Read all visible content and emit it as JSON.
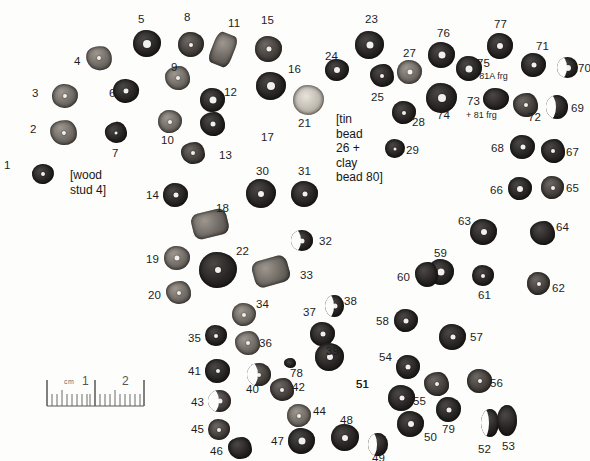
{
  "figure": {
    "kind": "archaeological-bead-layout-photograph",
    "background_color": "#fdfdfc",
    "bead_color_dark": "#262322",
    "bead_color_mid": "#433e3a",
    "bead_color_light": "#6f6963",
    "hole_color": "#f2f0ee"
  },
  "annotations": {
    "wood_stud": "[wood\nstud 4]",
    "tin_clay": "[tin\nbead\n26 +\nclay\nbead 80]",
    "frg_81a": "+81A frg",
    "frg_81": "+ 81 frg"
  },
  "scale": {
    "cm_label": "cm",
    "tick_1": "1",
    "tick_2": "2"
  },
  "beads": [
    {
      "id": "1",
      "label": "1",
      "x": 32,
      "y": 164,
      "w": 22,
      "h": 20,
      "tone": "t-dark",
      "shape": "sh-poly",
      "hole": 4,
      "lx": 4,
      "ly": 160,
      "rot": -8
    },
    {
      "id": "2",
      "label": "2",
      "x": 50,
      "y": 120,
      "w": 27,
      "h": 25,
      "tone": "t-light",
      "shape": "sh-poly2",
      "hole": 4,
      "lx": 30,
      "ly": 124,
      "rot": 6
    },
    {
      "id": "3",
      "label": "3",
      "x": 52,
      "y": 84,
      "w": 26,
      "h": 24,
      "tone": "t-light",
      "shape": "sh-poly",
      "hole": 4,
      "lx": 32,
      "ly": 88,
      "rot": -4
    },
    {
      "id": "4",
      "label": "4",
      "x": 86,
      "y": 46,
      "w": 26,
      "h": 24,
      "tone": "t-light",
      "shape": "sh-poly2",
      "hole": 4,
      "lx": 74,
      "ly": 56,
      "rot": 10
    },
    {
      "id": "5",
      "label": "5",
      "x": 133,
      "y": 30,
      "w": 28,
      "h": 27,
      "tone": "t-dark",
      "shape": "sh-poly",
      "hole": 8,
      "lx": 138,
      "ly": 14,
      "rot": 0
    },
    {
      "id": "6",
      "label": "6",
      "x": 113,
      "y": 79,
      "w": 26,
      "h": 24,
      "tone": "t-dark",
      "shape": "sh-poly",
      "hole": 5,
      "lx": 109,
      "ly": 88,
      "rot": 4
    },
    {
      "id": "7",
      "label": "7",
      "x": 105,
      "y": 122,
      "w": 22,
      "h": 21,
      "tone": "t-dark",
      "shape": "sh-poly2",
      "hole": 3,
      "lx": 112,
      "ly": 148,
      "rot": -6
    },
    {
      "id": "8",
      "label": "8",
      "x": 178,
      "y": 32,
      "w": 26,
      "h": 25,
      "tone": "t-mid",
      "shape": "sh-poly",
      "hole": 4,
      "lx": 184,
      "ly": 12,
      "rot": 0
    },
    {
      "id": "9",
      "label": "9",
      "x": 165,
      "y": 66,
      "w": 25,
      "h": 24,
      "tone": "t-light",
      "shape": "sh-poly2",
      "hole": 4,
      "lx": 171,
      "ly": 62,
      "rot": 0
    },
    {
      "id": "10",
      "label": "10",
      "x": 158,
      "y": 110,
      "w": 24,
      "h": 23,
      "tone": "t-light",
      "shape": "sh-poly",
      "hole": 4,
      "lx": 161,
      "ly": 135,
      "rot": 0
    },
    {
      "id": "11",
      "label": "11",
      "x": 212,
      "y": 33,
      "w": 22,
      "h": 33,
      "tone": "t-light",
      "shape": "sh-tube",
      "hole": 0,
      "lx": 228,
      "ly": 18,
      "rot": 22
    },
    {
      "id": "12",
      "label": "12",
      "x": 200,
      "y": 88,
      "w": 25,
      "h": 24,
      "tone": "t-dark",
      "shape": "sh-poly",
      "hole": 7,
      "lx": 224,
      "ly": 87,
      "rot": 0
    },
    {
      "id": "13",
      "label": "13",
      "x": 181,
      "y": 142,
      "w": 24,
      "h": 22,
      "tone": "t-mid",
      "shape": "sh-poly2",
      "hole": 4,
      "lx": 219,
      "ly": 150,
      "rot": 0
    },
    {
      "id": "14",
      "label": "14",
      "x": 163,
      "y": 183,
      "w": 25,
      "h": 24,
      "tone": "t-dark",
      "shape": "sh-poly",
      "hole": 5,
      "lx": 146,
      "ly": 190,
      "rot": 0
    },
    {
      "id": "15",
      "label": "15",
      "x": 255,
      "y": 36,
      "w": 27,
      "h": 26,
      "tone": "t-mid",
      "shape": "sh-poly",
      "hole": 5,
      "lx": 261,
      "ly": 15,
      "rot": 0
    },
    {
      "id": "16",
      "label": "16",
      "x": 256,
      "y": 72,
      "w": 30,
      "h": 28,
      "tone": "t-dark",
      "shape": "sh-poly",
      "hole": 8,
      "lx": 288,
      "ly": 64,
      "rot": 0
    },
    {
      "id": "17",
      "label": "17",
      "x": 200,
      "y": 112,
      "w": 25,
      "h": 24,
      "tone": "t-dark",
      "shape": "sh-poly2",
      "hole": 5,
      "lx": 261,
      "ly": 132,
      "rot": 0
    },
    {
      "id": "18",
      "label": "18",
      "x": 192,
      "y": 211,
      "w": 36,
      "h": 26,
      "tone": "t-light",
      "shape": "sh-tube",
      "hole": 0,
      "lx": 216,
      "ly": 203,
      "rot": -14
    },
    {
      "id": "19",
      "label": "19",
      "x": 164,
      "y": 246,
      "w": 26,
      "h": 24,
      "tone": "t-light",
      "shape": "sh-poly",
      "hole": 5,
      "lx": 146,
      "ly": 254,
      "rot": 0
    },
    {
      "id": "20",
      "label": "20",
      "x": 166,
      "y": 281,
      "w": 25,
      "h": 23,
      "tone": "t-light",
      "shape": "sh-poly2",
      "hole": 4,
      "lx": 148,
      "ly": 290,
      "rot": 0
    },
    {
      "id": "21",
      "label": "21",
      "x": 293,
      "y": 85,
      "w": 31,
      "h": 30,
      "tone": "t-speck",
      "shape": "sh-poly",
      "hole": 0,
      "lx": 298,
      "ly": 118,
      "rot": 0
    },
    {
      "id": "22",
      "label": "22",
      "x": 199,
      "y": 252,
      "w": 38,
      "h": 36,
      "tone": "t-dark",
      "shape": "sh-poly",
      "hole": 6,
      "lx": 236,
      "ly": 246,
      "rot": 0
    },
    {
      "id": "23",
      "label": "23",
      "x": 355,
      "y": 31,
      "w": 29,
      "h": 28,
      "tone": "t-dark",
      "shape": "sh-poly",
      "hole": 7,
      "lx": 365,
      "ly": 14,
      "rot": 0
    },
    {
      "id": "24",
      "label": "24",
      "x": 325,
      "y": 59,
      "w": 24,
      "h": 22,
      "tone": "t-dark",
      "shape": "sh-poly",
      "hole": 6,
      "lx": 325,
      "ly": 51,
      "rot": 0
    },
    {
      "id": "25",
      "label": "25",
      "x": 370,
      "y": 64,
      "w": 24,
      "h": 23,
      "tone": "t-dark",
      "shape": "sh-poly2",
      "hole": 4,
      "lx": 371,
      "ly": 92,
      "rot": 0
    },
    {
      "id": "27",
      "label": "27",
      "x": 397,
      "y": 60,
      "w": 25,
      "h": 24,
      "tone": "t-light",
      "shape": "sh-poly",
      "hole": 5,
      "lx": 403,
      "ly": 48,
      "rot": 0
    },
    {
      "id": "28",
      "label": "28",
      "x": 392,
      "y": 101,
      "w": 24,
      "h": 23,
      "tone": "t-dark",
      "shape": "sh-poly",
      "hole": 4,
      "lx": 412,
      "ly": 117,
      "rot": 0
    },
    {
      "id": "29",
      "label": "29",
      "x": 385,
      "y": 139,
      "w": 20,
      "h": 19,
      "tone": "t-dark",
      "shape": "sh-poly",
      "hole": 3,
      "lx": 406,
      "ly": 145,
      "rot": 0
    },
    {
      "id": "30",
      "label": "30",
      "x": 246,
      "y": 179,
      "w": 30,
      "h": 29,
      "tone": "t-dark",
      "shape": "sh-poly",
      "hole": 6,
      "lx": 256,
      "ly": 166,
      "rot": 0
    },
    {
      "id": "31",
      "label": "31",
      "x": 291,
      "y": 181,
      "w": 27,
      "h": 26,
      "tone": "t-dark",
      "shape": "sh-poly",
      "hole": 5,
      "lx": 298,
      "ly": 166,
      "rot": 0
    },
    {
      "id": "32",
      "label": "32",
      "x": 291,
      "y": 230,
      "w": 22,
      "h": 21,
      "tone": "t-dark",
      "shape": "crescent",
      "hole": 5,
      "lx": 319,
      "ly": 236,
      "rot": 0
    },
    {
      "id": "33",
      "label": "33",
      "x": 253,
      "y": 258,
      "w": 36,
      "h": 27,
      "tone": "t-light",
      "shape": "sh-tube",
      "hole": 0,
      "lx": 300,
      "ly": 270,
      "rot": -16
    },
    {
      "id": "34",
      "label": "34",
      "x": 232,
      "y": 303,
      "w": 24,
      "h": 23,
      "tone": "t-light",
      "shape": "sh-poly",
      "hole": 4,
      "lx": 256,
      "ly": 299,
      "rot": 0
    },
    {
      "id": "35",
      "label": "35",
      "x": 205,
      "y": 325,
      "w": 22,
      "h": 21,
      "tone": "t-dark",
      "shape": "sh-poly",
      "hole": 4,
      "lx": 188,
      "ly": 333,
      "rot": 0
    },
    {
      "id": "36",
      "label": "36",
      "x": 235,
      "y": 331,
      "w": 25,
      "h": 24,
      "tone": "t-light",
      "shape": "sh-poly2",
      "hole": 4,
      "lx": 259,
      "ly": 338,
      "rot": 0
    },
    {
      "id": "37",
      "label": "37",
      "x": 310,
      "y": 322,
      "w": 25,
      "h": 24,
      "tone": "t-dark",
      "shape": "sh-poly",
      "hole": 5,
      "lx": 303,
      "ly": 307,
      "rot": 0
    },
    {
      "id": "38",
      "label": "38",
      "x": 325,
      "y": 295,
      "w": 19,
      "h": 22,
      "tone": "t-dark",
      "shape": "crescent",
      "hole": 5,
      "lx": 344,
      "ly": 296,
      "rot": 0
    },
    {
      "id": "39",
      "label": "39",
      "x": 315,
      "y": 343,
      "w": 29,
      "h": 28,
      "tone": "t-dark",
      "shape": "sh-poly",
      "hole": 6,
      "lx": 326,
      "ly": 346,
      "rot": 0
    },
    {
      "id": "40",
      "label": "40",
      "x": 247,
      "y": 363,
      "w": 24,
      "h": 23,
      "tone": "t-mid",
      "shape": "crescent",
      "hole": 4,
      "lx": 246,
      "ly": 384,
      "rot": 0
    },
    {
      "id": "41",
      "label": "41",
      "x": 205,
      "y": 359,
      "w": 25,
      "h": 24,
      "tone": "t-dark",
      "shape": "sh-poly",
      "hole": 4,
      "lx": 188,
      "ly": 366,
      "rot": 0
    },
    {
      "id": "42",
      "label": "42",
      "x": 270,
      "y": 378,
      "w": 24,
      "h": 23,
      "tone": "t-mid",
      "shape": "sh-poly2",
      "hole": 4,
      "lx": 292,
      "ly": 382,
      "rot": 0
    },
    {
      "id": "43",
      "label": "43",
      "x": 208,
      "y": 390,
      "w": 23,
      "h": 22,
      "tone": "t-mid",
      "shape": "crescent",
      "hole": 5,
      "lx": 191,
      "ly": 397,
      "rot": 0
    },
    {
      "id": "44",
      "label": "44",
      "x": 287,
      "y": 404,
      "w": 24,
      "h": 23,
      "tone": "t-light",
      "shape": "sh-poly",
      "hole": 4,
      "lx": 313,
      "ly": 406,
      "rot": 0
    },
    {
      "id": "45",
      "label": "45",
      "x": 208,
      "y": 419,
      "w": 22,
      "h": 21,
      "tone": "t-mid",
      "shape": "sh-poly",
      "hole": 4,
      "lx": 191,
      "ly": 424,
      "rot": 0
    },
    {
      "id": "46",
      "label": "46",
      "x": 228,
      "y": 437,
      "w": 24,
      "h": 22,
      "tone": "t-dark",
      "shape": "sh-poly2",
      "hole": 0,
      "lx": 210,
      "ly": 446,
      "rot": 0
    },
    {
      "id": "47",
      "label": "47",
      "x": 288,
      "y": 428,
      "w": 27,
      "h": 26,
      "tone": "t-dark",
      "shape": "sh-poly",
      "hole": 7,
      "lx": 271,
      "ly": 436,
      "rot": 0
    },
    {
      "id": "48",
      "label": "48",
      "x": 331,
      "y": 424,
      "w": 28,
      "h": 27,
      "tone": "t-dark",
      "shape": "sh-poly",
      "hole": 6,
      "lx": 340,
      "ly": 415,
      "rot": 0
    },
    {
      "id": "49",
      "label": "49",
      "x": 368,
      "y": 433,
      "w": 20,
      "h": 23,
      "tone": "t-dark",
      "shape": "crescent",
      "hole": 0,
      "lx": 372,
      "ly": 453,
      "rot": 0
    },
    {
      "id": "50",
      "label": "50",
      "x": 397,
      "y": 411,
      "w": 27,
      "h": 26,
      "tone": "t-dark",
      "shape": "sh-poly",
      "hole": 6,
      "lx": 424,
      "ly": 432,
      "rot": 0
    },
    {
      "id": "51",
      "label": "51",
      "x": 556,
      "y": 999,
      "w": 0,
      "h": 0,
      "tone": "t-dark",
      "shape": "sh-poly",
      "hole": 0,
      "lx": 356,
      "ly": 379,
      "rot": 0
    },
    {
      "id": "52",
      "label": "52",
      "x": 481,
      "y": 409,
      "w": 18,
      "h": 28,
      "tone": "t-dark",
      "shape": "crescent",
      "hole": 0,
      "lx": 478,
      "ly": 444,
      "rot": 0
    },
    {
      "id": "53",
      "label": "53",
      "x": 497,
      "y": 405,
      "w": 20,
      "h": 31,
      "tone": "t-dark",
      "shape": "crescent-r",
      "hole": 0,
      "lx": 502,
      "ly": 441,
      "rot": 0
    },
    {
      "id": "54",
      "label": "54",
      "x": 396,
      "y": 355,
      "w": 24,
      "h": 24,
      "tone": "t-dark",
      "shape": "sh-poly",
      "hole": 5,
      "lx": 379,
      "ly": 352,
      "rot": 0
    },
    {
      "id": "55",
      "label": "55",
      "x": 424,
      "y": 372,
      "w": 25,
      "h": 24,
      "tone": "t-mid",
      "shape": "sh-poly2",
      "hole": 4,
      "lx": 413,
      "ly": 396,
      "rot": 0
    },
    {
      "id": "56",
      "label": "56",
      "x": 467,
      "y": 369,
      "w": 25,
      "h": 24,
      "tone": "t-mid",
      "shape": "sh-poly",
      "hole": 4,
      "lx": 490,
      "ly": 378,
      "rot": 0
    },
    {
      "id": "57",
      "label": "57",
      "x": 439,
      "y": 324,
      "w": 27,
      "h": 26,
      "tone": "t-dark",
      "shape": "sh-poly",
      "hole": 5,
      "lx": 470,
      "ly": 332,
      "rot": 0
    },
    {
      "id": "58",
      "label": "58",
      "x": 394,
      "y": 309,
      "w": 24,
      "h": 23,
      "tone": "t-dark",
      "shape": "sh-poly",
      "hole": 5,
      "lx": 376,
      "ly": 316,
      "rot": 0
    },
    {
      "id": "59",
      "label": "59",
      "x": 428,
      "y": 259,
      "w": 26,
      "h": 26,
      "tone": "t-dark",
      "shape": "sh-poly",
      "hole": 7,
      "lx": 434,
      "ly": 248,
      "rot": 0
    },
    {
      "id": "60",
      "label": "60",
      "x": 415,
      "y": 262,
      "w": 23,
      "h": 25,
      "tone": "t-dark",
      "shape": "sh-poly2",
      "hole": 0,
      "lx": 397,
      "ly": 272,
      "rot": 0
    },
    {
      "id": "61",
      "label": "61",
      "x": 472,
      "y": 265,
      "w": 22,
      "h": 21,
      "tone": "t-dark",
      "shape": "sh-poly",
      "hole": 4,
      "lx": 478,
      "ly": 290,
      "rot": 0
    },
    {
      "id": "62",
      "label": "62",
      "x": 527,
      "y": 272,
      "w": 23,
      "h": 23,
      "tone": "t-mid",
      "shape": "sh-poly",
      "hole": 4,
      "lx": 552,
      "ly": 283,
      "rot": 0
    },
    {
      "id": "63",
      "label": "63",
      "x": 470,
      "y": 219,
      "w": 27,
      "h": 26,
      "tone": "t-dark",
      "shape": "sh-poly",
      "hole": 6,
      "lx": 458,
      "ly": 216,
      "rot": 0
    },
    {
      "id": "64",
      "label": "64",
      "x": 530,
      "y": 221,
      "w": 25,
      "h": 24,
      "tone": "t-dark",
      "shape": "sh-poly2",
      "hole": 0,
      "lx": 556,
      "ly": 222,
      "rot": 0
    },
    {
      "id": "65",
      "label": "65",
      "x": 541,
      "y": 176,
      "w": 23,
      "h": 23,
      "tone": "t-mid",
      "shape": "sh-poly",
      "hole": 4,
      "lx": 566,
      "ly": 183,
      "rot": 0
    },
    {
      "id": "66",
      "label": "66",
      "x": 508,
      "y": 177,
      "w": 24,
      "h": 23,
      "tone": "t-dark",
      "shape": "sh-poly",
      "hole": 6,
      "lx": 490,
      "ly": 185,
      "rot": 0
    },
    {
      "id": "67",
      "label": "67",
      "x": 541,
      "y": 139,
      "w": 24,
      "h": 24,
      "tone": "t-dark",
      "shape": "sh-poly2",
      "hole": 4,
      "lx": 566,
      "ly": 147,
      "rot": 0
    },
    {
      "id": "68",
      "label": "68",
      "x": 510,
      "y": 135,
      "w": 25,
      "h": 24,
      "tone": "t-dark",
      "shape": "sh-poly",
      "hole": 5,
      "lx": 491,
      "ly": 143,
      "rot": 0
    },
    {
      "id": "69",
      "label": "69",
      "x": 546,
      "y": 95,
      "w": 22,
      "h": 24,
      "tone": "t-dark",
      "shape": "crescent",
      "hole": 0,
      "lx": 571,
      "ly": 103,
      "rot": 0
    },
    {
      "id": "70",
      "label": "70",
      "x": 557,
      "y": 57,
      "w": 21,
      "h": 21,
      "tone": "t-dark",
      "shape": "crescent",
      "hole": 6,
      "lx": 578,
      "ly": 63,
      "rot": 0
    },
    {
      "id": "71",
      "label": "71",
      "x": 521,
      "y": 53,
      "w": 25,
      "h": 24,
      "tone": "t-dark",
      "shape": "sh-poly",
      "hole": 5,
      "lx": 536,
      "ly": 41,
      "rot": 0
    },
    {
      "id": "72",
      "label": "72",
      "x": 513,
      "y": 93,
      "w": 25,
      "h": 24,
      "tone": "t-mid",
      "shape": "sh-poly2",
      "hole": 4,
      "lx": 528,
      "ly": 112,
      "rot": 0
    },
    {
      "id": "73",
      "label": "73",
      "x": 483,
      "y": 88,
      "w": 26,
      "h": 22,
      "tone": "t-dark",
      "shape": "sh-poly",
      "hole": 0,
      "lx": 467,
      "ly": 96,
      "rot": 0
    },
    {
      "id": "74",
      "label": "74",
      "x": 426,
      "y": 83,
      "w": 31,
      "h": 30,
      "tone": "t-dark",
      "shape": "sh-poly",
      "hole": 8,
      "lx": 437,
      "ly": 110,
      "rot": 0
    },
    {
      "id": "75",
      "label": "75",
      "x": 456,
      "y": 56,
      "w": 26,
      "h": 25,
      "tone": "t-dark",
      "shape": "sh-poly",
      "hole": 7,
      "lx": 477,
      "ly": 58,
      "rot": 0
    },
    {
      "id": "76",
      "label": "76",
      "x": 428,
      "y": 42,
      "w": 27,
      "h": 26,
      "tone": "t-dark",
      "shape": "sh-poly",
      "hole": 7,
      "lx": 437,
      "ly": 28,
      "rot": 0
    },
    {
      "id": "77",
      "label": "77",
      "x": 487,
      "y": 33,
      "w": 26,
      "h": 26,
      "tone": "t-dark",
      "shape": "sh-poly",
      "hole": 6,
      "lx": 494,
      "ly": 19,
      "rot": 0
    },
    {
      "id": "78",
      "label": "78",
      "x": 284,
      "y": 358,
      "w": 12,
      "h": 10,
      "tone": "t-dark",
      "shape": "sh-poly2",
      "hole": 0,
      "lx": 290,
      "ly": 368,
      "rot": 0
    },
    {
      "id": "79",
      "label": "79",
      "x": 436,
      "y": 397,
      "w": 25,
      "h": 25,
      "tone": "t-dark",
      "shape": "sh-poly",
      "hole": 5,
      "lx": 442,
      "ly": 424,
      "rot": 0
    }
  ],
  "extra_beads": [
    {
      "id": "51b",
      "label": "51",
      "x": 388,
      "y": 385,
      "w": 27,
      "h": 26,
      "tone": "t-dark",
      "shape": "sh-poly",
      "hole": 5,
      "lx": 356,
      "ly": 379,
      "rot": 0
    }
  ]
}
